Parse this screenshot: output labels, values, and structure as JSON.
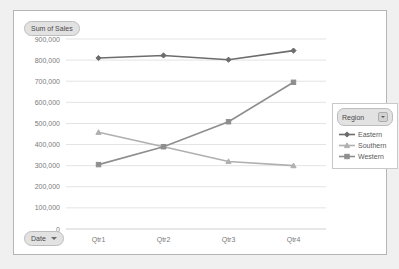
{
  "value_field_button": {
    "label": "Sum of Sales"
  },
  "axis_field_button": {
    "label": "Date",
    "caret_icon": "chevron-down-icon"
  },
  "legend": {
    "title": "Region",
    "dropdown_icon": "chevron-down-icon",
    "entries": [
      {
        "label": "Eastern",
        "color": "#6d6d6d",
        "marker": "diamond"
      },
      {
        "label": "Southern",
        "color": "#b0b0b0",
        "marker": "triangle"
      },
      {
        "label": "Western",
        "color": "#8e8e8e",
        "marker": "square"
      }
    ]
  },
  "chart_data": {
    "type": "line",
    "title": "Sum of Sales",
    "xlabel": "",
    "ylabel": "Sum of Sales",
    "categories": [
      "Qtr1",
      "Qtr2",
      "Qtr3",
      "Qtr4"
    ],
    "ylim": [
      0,
      900000
    ],
    "y_ticks": [
      0,
      100000,
      200000,
      300000,
      400000,
      500000,
      600000,
      700000,
      800000,
      900000
    ],
    "y_tick_labels": [
      "0",
      "100,000",
      "200,000",
      "300,000",
      "400,000",
      "500,000",
      "600,000",
      "700,000",
      "800,000",
      "900,000"
    ],
    "grid": true,
    "legend_position": "right",
    "series": [
      {
        "name": "Eastern",
        "color": "#6d6d6d",
        "marker": "diamond",
        "values": [
          810000,
          822000,
          802000,
          845000
        ]
      },
      {
        "name": "Southern",
        "color": "#b0b0b0",
        "marker": "triangle",
        "values": [
          458000,
          390000,
          320000,
          300000
        ]
      },
      {
        "name": "Western",
        "color": "#8e8e8e",
        "marker": "square",
        "values": [
          305000,
          390000,
          508000,
          695000
        ]
      }
    ]
  }
}
